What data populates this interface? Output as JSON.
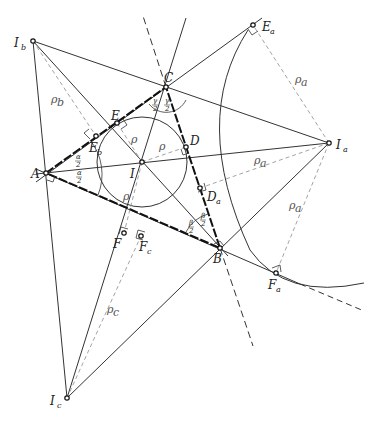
{
  "diagram": {
    "type": "geometry",
    "points": {
      "A": {
        "label": "A",
        "sub": "",
        "x": 46,
        "y": 173
      },
      "B": {
        "label": "B",
        "sub": "",
        "x": 220,
        "y": 248
      },
      "C": {
        "label": "C",
        "sub": "",
        "x": 166,
        "y": 87
      },
      "I": {
        "label": "I",
        "sub": "",
        "x": 142,
        "y": 162
      },
      "Ia": {
        "label": "I",
        "sub": "a",
        "x": 329,
        "y": 143
      },
      "Ib": {
        "label": "I",
        "sub": "b",
        "x": 33,
        "y": 41
      },
      "Ic": {
        "label": "I",
        "sub": "c",
        "x": 67,
        "y": 398
      },
      "D": {
        "label": "D",
        "sub": "",
        "x": 186,
        "y": 147
      },
      "E": {
        "label": "E",
        "sub": "",
        "x": 117,
        "y": 123
      },
      "F": {
        "label": "F",
        "sub": "",
        "x": 124,
        "y": 233
      },
      "Da": {
        "label": "D",
        "sub": "a",
        "x": 200,
        "y": 188
      },
      "Ea": {
        "label": "E",
        "sub": "a",
        "x": 253,
        "y": 25
      },
      "Fa": {
        "label": "F",
        "sub": "a",
        "x": 276,
        "y": 273
      },
      "Eb": {
        "label": "E",
        "sub": "b",
        "x": 96,
        "y": 136
      },
      "Fc": {
        "label": "F",
        "sub": "c",
        "x": 141,
        "y": 236
      }
    },
    "radius_labels": {
      "rho": "ρ",
      "rho_a": "ρ",
      "rho_a_sub": "a",
      "rho_b": "ρ",
      "rho_b_sub": "b",
      "rho_c": "ρ",
      "rho_c_sub": "c"
    },
    "angle_labels": {
      "alpha_half_num": "α",
      "beta_half_num": "β",
      "gamma_half_num": "γ",
      "den": "2"
    },
    "colors": {
      "line": "#333333",
      "thick": "#111111",
      "dashed": "#999999"
    }
  }
}
